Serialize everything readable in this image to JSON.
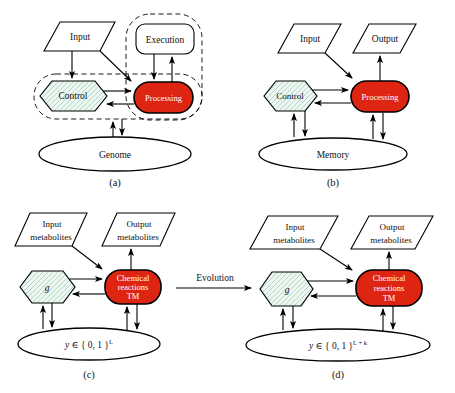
{
  "colors": {
    "node_red": "#dd2512",
    "hatch_bg": "#edf6f1",
    "hatch_line": "#a9d6c1"
  },
  "fig_a": {
    "caption": "(a)",
    "input_label": "Input",
    "execution_label": "Execution",
    "control_label": "Control",
    "processing_label": "Processing",
    "store_label": "Genome"
  },
  "fig_b": {
    "caption": "(b)",
    "input_label": "Input",
    "output_label": "Output",
    "control_label": "Control",
    "processing_label": "Processing",
    "store_label": "Memory"
  },
  "fig_c": {
    "caption": "(c)",
    "input_line1": "Input",
    "input_line2": "metabolites",
    "output_line1": "Output",
    "output_line2": "metabolites",
    "genome_label": "g",
    "tm_line1": "Chemical",
    "tm_line2": "reactions",
    "tm_line3": "TM",
    "state_var": "y",
    "state_set": " ∈ { 0, 1 }",
    "state_sup": "L"
  },
  "fig_d": {
    "caption": "(d)",
    "input_line1": "Input",
    "input_line2": "metabolites",
    "output_line1": "Output",
    "output_line2": "metabolites",
    "genome_label": "g",
    "tm_line1": "Chemical",
    "tm_line2": "reactions",
    "tm_line3": "TM",
    "state_var": "y",
    "state_set": " ∈ { 0, 1 }",
    "state_sup": "L + k"
  },
  "evolution": {
    "label": "Evolution"
  }
}
